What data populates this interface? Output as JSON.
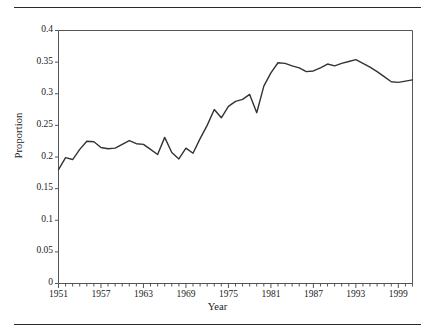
{
  "chart_data": {
    "type": "line",
    "title": "",
    "xlabel": "Year",
    "ylabel": "Proportion",
    "xlim": [
      1951,
      2001
    ],
    "ylim": [
      0,
      0.4
    ],
    "grid": false,
    "legend": null,
    "line_color": "#333333",
    "x_tick_labels": [
      "1951",
      "1957",
      "1963",
      "1969",
      "1975",
      "1981",
      "1987",
      "1993",
      "1999"
    ],
    "x_tick_values": [
      1951,
      1957,
      1963,
      1969,
      1975,
      1981,
      1987,
      1993,
      1999
    ],
    "x_minor_tick_step": 1,
    "y_tick_labels": [
      "0",
      "0.05",
      "0.1",
      "0.15",
      "0.2",
      "0.25",
      "0.3",
      "0.35",
      "0.4"
    ],
    "y_tick_values": [
      0,
      0.05,
      0.1,
      0.15,
      0.2,
      0.25,
      0.3,
      0.35,
      0.4
    ],
    "x": [
      1951,
      1952,
      1953,
      1954,
      1955,
      1956,
      1957,
      1958,
      1959,
      1960,
      1961,
      1962,
      1963,
      1964,
      1965,
      1966,
      1967,
      1968,
      1969,
      1970,
      1971,
      1972,
      1973,
      1974,
      1975,
      1976,
      1977,
      1978,
      1979,
      1980,
      1981,
      1982,
      1983,
      1984,
      1985,
      1986,
      1987,
      1988,
      1989,
      1990,
      1991,
      1992,
      1993,
      1994,
      1995,
      1996,
      1997,
      1998,
      1999,
      2000,
      2001
    ],
    "values": [
      0.18,
      0.199,
      0.196,
      0.212,
      0.225,
      0.224,
      0.215,
      0.213,
      0.214,
      0.22,
      0.226,
      0.221,
      0.22,
      0.212,
      0.204,
      0.231,
      0.207,
      0.197,
      0.214,
      0.206,
      0.229,
      0.25,
      0.275,
      0.262,
      0.28,
      0.288,
      0.291,
      0.299,
      0.27,
      0.312,
      0.333,
      0.349,
      0.348,
      0.344,
      0.341,
      0.335,
      0.336,
      0.341,
      0.347,
      0.344,
      0.348,
      0.351,
      0.354,
      0.348,
      0.342,
      0.335,
      0.327,
      0.319,
      0.318,
      0.32,
      0.322
    ]
  },
  "figure": {
    "top_rule": "horizontal-rule",
    "bottom_rule": "horizontal-rule"
  }
}
